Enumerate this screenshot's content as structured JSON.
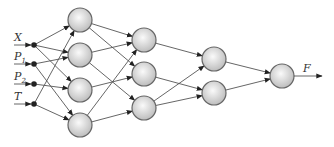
{
  "diagram": {
    "type": "neural-network",
    "inputs": [
      {
        "id": "X",
        "label": "X",
        "sub": "",
        "y": 45
      },
      {
        "id": "P1",
        "label": "P",
        "sub": "1",
        "y": 64
      },
      {
        "id": "P2",
        "label": "P",
        "sub": "2",
        "y": 84
      },
      {
        "id": "T",
        "label": "T",
        "sub": "",
        "y": 104
      }
    ],
    "layers": [
      {
        "name": "hidden-1",
        "x": 80,
        "nodes": [
          20,
          55,
          90,
          125
        ]
      },
      {
        "name": "hidden-2",
        "x": 144,
        "nodes": [
          40,
          74,
          108
        ]
      },
      {
        "name": "hidden-3",
        "x": 214,
        "nodes": [
          59,
          93
        ]
      },
      {
        "name": "output",
        "x": 282,
        "nodes": [
          76
        ]
      }
    ],
    "input_edges": [
      [
        "X",
        0
      ],
      [
        "X",
        1
      ],
      [
        "X",
        2
      ],
      [
        "P1",
        1
      ],
      [
        "P1",
        3
      ],
      [
        "P2",
        2
      ],
      [
        "T",
        0
      ],
      [
        "T",
        3
      ]
    ],
    "layer_edges": [
      [
        [
          0,
          0
        ],
        [
          0,
          1
        ]
      ],
      [
        [
          1,
          0
        ],
        [
          1,
          2
        ]
      ],
      [
        [
          2,
          1
        ]
      ],
      [
        [
          3,
          0
        ],
        [
          3,
          2
        ]
      ]
    ],
    "layer2_edges": [
      [
        0,
        0
      ],
      [
        1,
        1
      ],
      [
        2,
        0
      ],
      [
        2,
        1
      ]
    ],
    "layer3_edges": [
      [
        0,
        0
      ],
      [
        1,
        0
      ]
    ],
    "output": {
      "label": "F"
    },
    "colors": {
      "node_fill_light": "#fafafa",
      "node_fill_dark": "#bdbdbd",
      "node_stroke": "#666666",
      "edge": "#555555",
      "dot": "#222222"
    }
  }
}
